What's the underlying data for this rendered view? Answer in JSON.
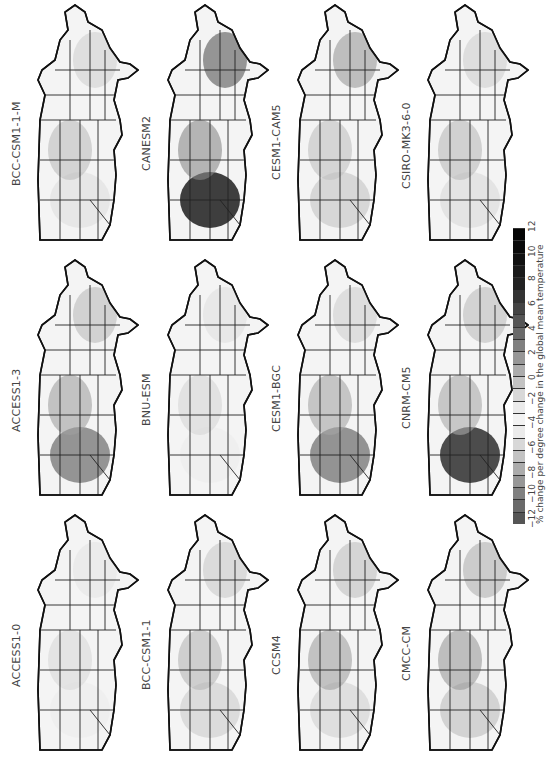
{
  "figure": {
    "orientation": "rotated 90 degrees counter-clockwise",
    "grid": {
      "rows": 3,
      "cols": 4
    },
    "panels": [
      {
        "row": 0,
        "col": 0,
        "label": "BCC-CSM1-1-M"
      },
      {
        "row": 0,
        "col": 1,
        "label": "CANESM2"
      },
      {
        "row": 0,
        "col": 2,
        "label": "CESM1-CAM5"
      },
      {
        "row": 0,
        "col": 3,
        "label": "CSIRO-MK3-6-0"
      },
      {
        "row": 1,
        "col": 0,
        "label": "ACCESS1-3"
      },
      {
        "row": 1,
        "col": 1,
        "label": "BNU-ESM"
      },
      {
        "row": 1,
        "col": 2,
        "label": "CESM1-BGC"
      },
      {
        "row": 1,
        "col": 3,
        "label": "CNRM-CM5"
      },
      {
        "row": 2,
        "col": 0,
        "label": "ACCESS1-0"
      },
      {
        "row": 2,
        "col": 1,
        "label": "BCC-CSM1-1"
      },
      {
        "row": 2,
        "col": 2,
        "label": "CCSM4"
      },
      {
        "row": 2,
        "col": 3,
        "label": "CMCC-CM"
      }
    ]
  },
  "colorbar": {
    "title": "% change per degree change in the global mean temperature",
    "ticks": [
      "−12",
      "−10",
      "−8",
      "−6",
      "−4",
      "−2",
      "0",
      "2",
      "4",
      "6",
      "8",
      "10",
      "12"
    ],
    "colors": [
      "#555555",
      "#6a6a6a",
      "#808080",
      "#979797",
      "#acacac",
      "#c3c3c3",
      "#d8d8d8",
      "#ebebeb",
      "#f3f3f3",
      "#ebebeb",
      "#d8d8d8",
      "#c3c3c3",
      "#acacac",
      "#979797",
      "#808080",
      "#6a6a6a",
      "#555555",
      "#444444",
      "#333333",
      "#222222",
      "#1a1a1a",
      "#111111",
      "#0a0a0a",
      "#050505"
    ]
  }
}
